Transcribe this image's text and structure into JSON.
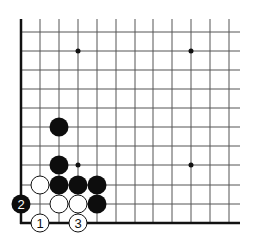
{
  "diagram": {
    "type": "go-board-corner",
    "grid": {
      "x_lines": [
        21,
        40,
        59,
        78,
        97,
        116,
        135,
        153,
        172,
        191,
        210,
        229
      ],
      "y_lines": [
        32,
        51,
        70,
        89,
        108,
        127,
        146,
        165,
        185,
        204,
        223
      ],
      "top_extend": 19,
      "right_extend": 240,
      "line_color": "#555555",
      "edge_color": "#111111"
    },
    "star_points": [
      {
        "x": 78,
        "y": 51
      },
      {
        "x": 191,
        "y": 51
      },
      {
        "x": 78,
        "y": 165
      },
      {
        "x": 191,
        "y": 165
      }
    ],
    "stones": [
      {
        "color": "black",
        "x": 59,
        "y": 127,
        "label": ""
      },
      {
        "color": "black",
        "x": 59,
        "y": 165,
        "label": ""
      },
      {
        "color": "white",
        "x": 40,
        "y": 185,
        "label": ""
      },
      {
        "color": "black",
        "x": 59,
        "y": 185,
        "label": ""
      },
      {
        "color": "black",
        "x": 78,
        "y": 185,
        "label": ""
      },
      {
        "color": "black",
        "x": 97,
        "y": 185,
        "label": ""
      },
      {
        "color": "white",
        "x": 59,
        "y": 204,
        "label": ""
      },
      {
        "color": "white",
        "x": 78,
        "y": 204,
        "label": ""
      },
      {
        "color": "black",
        "x": 97,
        "y": 204,
        "label": ""
      },
      {
        "color": "black",
        "x": 21,
        "y": 204,
        "label": "2"
      },
      {
        "color": "white",
        "x": 40,
        "y": 223,
        "label": "1"
      },
      {
        "color": "white",
        "x": 78,
        "y": 223,
        "label": "3"
      }
    ],
    "stone_radius": 9,
    "colors": {
      "black_stone": "#0d0d0d",
      "white_stone": "#ffffff",
      "white_stroke": "#111111"
    }
  }
}
